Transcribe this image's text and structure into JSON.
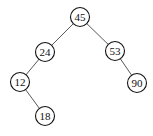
{
  "diagram": {
    "type": "binary-search-tree",
    "nodes": [
      {
        "id": "n45",
        "label": "45",
        "x": 80,
        "y": 17
      },
      {
        "id": "n24",
        "label": "24",
        "x": 45,
        "y": 52
      },
      {
        "id": "n53",
        "label": "53",
        "x": 115,
        "y": 51
      },
      {
        "id": "n12",
        "label": "12",
        "x": 20,
        "y": 82
      },
      {
        "id": "n90",
        "label": "90",
        "x": 137,
        "y": 83
      },
      {
        "id": "n18",
        "label": "18",
        "x": 45,
        "y": 116
      }
    ],
    "edges": [
      {
        "from": "n45",
        "to": "n24"
      },
      {
        "from": "n45",
        "to": "n53"
      },
      {
        "from": "n24",
        "to": "n12"
      },
      {
        "from": "n53",
        "to": "n90"
      },
      {
        "from": "n12",
        "to": "n18"
      }
    ]
  }
}
